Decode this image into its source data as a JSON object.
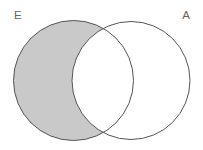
{
  "figure": {
    "type": "venn-diagram",
    "title": "",
    "background_color": "#ffffff",
    "width": 203,
    "height": 150
  },
  "sets": [
    {
      "id": "E",
      "label": "E",
      "label_position": "top-left",
      "label_color": "#646464",
      "center_x": 73.5,
      "center_y": 80.5,
      "radius": 60,
      "stroke_color": "#555555",
      "fill_color": "#ffffff"
    },
    {
      "id": "A",
      "label": "A",
      "label_position": "top-right",
      "label_color": "#646464",
      "center_x": 131,
      "center_y": 80.5,
      "radius": 59,
      "stroke_color": "#555555",
      "fill_color": "#ffffff"
    }
  ],
  "regions": [
    {
      "id": "E-only",
      "description": "E minus A",
      "shaded": true,
      "fill_color": "#c9c9c9"
    },
    {
      "id": "E-and-A",
      "description": "E intersect A",
      "shaded": false,
      "fill_color": "#ffffff"
    },
    {
      "id": "A-only",
      "description": "A minus E",
      "shaded": false,
      "fill_color": "#ffffff"
    }
  ],
  "style": {
    "stroke_width": 1,
    "label_font_size": 11.5
  }
}
